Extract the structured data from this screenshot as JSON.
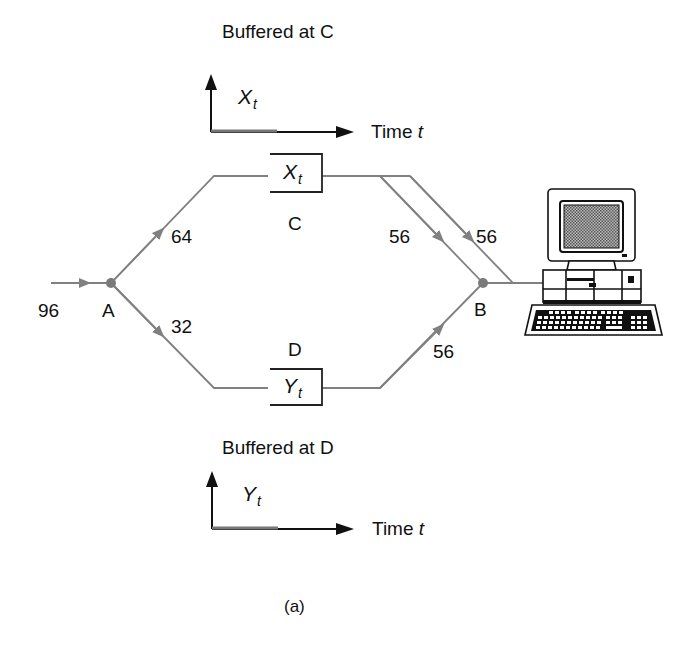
{
  "figure": {
    "caption": "(a)",
    "colors": {
      "line": "#808080",
      "node": "#7a7a7a",
      "text": "#111111",
      "axis": "#111111",
      "screen": "#8a8a8a"
    },
    "top_plot": {
      "title": "Buffered at C",
      "y_var": "X",
      "y_sub": "t",
      "x_label": "Time",
      "x_var": "t"
    },
    "bottom_plot": {
      "title": "Buffered at D",
      "y_var": "Y",
      "y_sub": "t",
      "x_label": "Time",
      "x_var": "t"
    },
    "nodes": {
      "a": "A",
      "b": "B",
      "c": "C",
      "d": "D"
    },
    "buffers": {
      "c": {
        "var": "X",
        "sub": "t"
      },
      "d": {
        "var": "Y",
        "sub": "t"
      }
    },
    "rates": {
      "input": "96",
      "a_to_c": "64",
      "a_to_d": "32",
      "c_to_b_1": "56",
      "c_to_b_2": "56",
      "d_to_b": "56"
    },
    "destination": "computer-terminal"
  }
}
